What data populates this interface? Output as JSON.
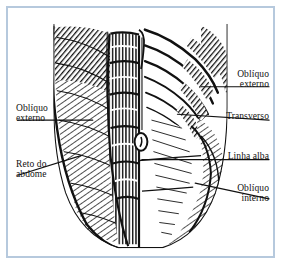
{
  "figure": {
    "kind": "anatomical-illustration",
    "style": "gravura hachurada preto e branco",
    "frame_color": "#b6c9dd",
    "background_color": "#ffffff",
    "ink_color": "#111111"
  },
  "labels": {
    "obliquo_externo_right": {
      "line1": "Oblíquo",
      "line2": "externo"
    },
    "transverso": {
      "line1": "Transverso"
    },
    "linha_alba": {
      "line1": "Linha alba"
    },
    "obliquo_interno": {
      "line1": "Oblíquo",
      "line2": "interno"
    },
    "obliquo_externo_left": {
      "line1": "Oblíquo",
      "line2": "externo"
    },
    "reto_do_abdome": {
      "line1": "Reto do",
      "line2": "abdome"
    }
  },
  "structures": [
    "oblíquo externo",
    "oblíquo interno",
    "transverso",
    "reto do abdome",
    "linha alba",
    "umbigo",
    "arcabouço costal"
  ]
}
